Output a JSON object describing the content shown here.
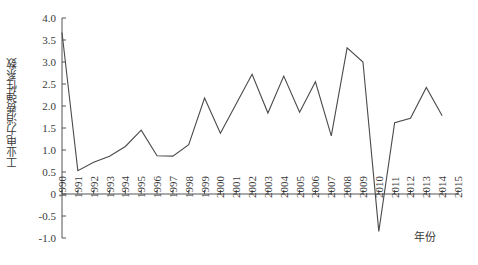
{
  "chart_data": {
    "type": "line",
    "title": "",
    "subtitle": "",
    "xlabel": "年份",
    "ylabel": "工业电力消费弹性系数",
    "xlim": [
      1990,
      2015
    ],
    "ylim": [
      -1.0,
      4.0
    ],
    "grid": false,
    "legend": null,
    "y_ticks": [
      "4.0",
      "3.5",
      "3.0",
      "2.5",
      "2.0",
      "1.5",
      "1.0",
      "0.5",
      "0",
      "-0.5",
      "-1.0"
    ],
    "y_tick_values": [
      4.0,
      3.5,
      3.0,
      2.5,
      2.0,
      1.5,
      1.0,
      0.5,
      0,
      -0.5,
      -1.0
    ],
    "x_ticks": [
      "1990",
      "1991",
      "1992",
      "1993",
      "1994",
      "1995",
      "1996",
      "1997",
      "1998",
      "1999",
      "2000",
      "2001",
      "2002",
      "2003",
      "2004",
      "2005",
      "2006",
      "2007",
      "2008",
      "2009",
      "2010",
      "2011",
      "2012",
      "2013",
      "2014",
      "2015"
    ],
    "x": [
      1990,
      1991,
      1992,
      1993,
      1994,
      1995,
      1996,
      1997,
      1998,
      1999,
      2000,
      2001,
      2002,
      2003,
      2004,
      2005,
      2006,
      2007,
      2008,
      2009,
      2010,
      2011,
      2012,
      2013,
      2014
    ],
    "values": [
      3.67,
      0.53,
      0.72,
      0.86,
      1.08,
      1.45,
      0.87,
      0.86,
      1.12,
      2.18,
      1.38,
      2.05,
      2.72,
      1.84,
      2.68,
      1.86,
      2.55,
      1.32,
      3.32,
      3.0,
      -0.85,
      1.62,
      1.72,
      2.42,
      1.78
    ],
    "series": [
      {
        "name": "工业电力消费弹性系数",
        "color": "#4a4a4a",
        "values": [
          3.67,
          0.53,
          0.72,
          0.86,
          1.08,
          1.45,
          0.87,
          0.86,
          1.12,
          2.18,
          1.38,
          2.05,
          2.72,
          1.84,
          2.68,
          1.86,
          2.55,
          1.32,
          3.32,
          3.0,
          -0.85,
          1.62,
          1.72,
          2.42,
          1.78
        ]
      }
    ]
  }
}
